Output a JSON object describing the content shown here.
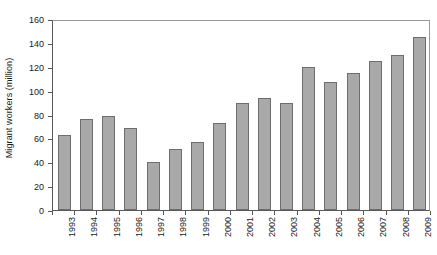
{
  "chart_data": {
    "type": "bar",
    "title": "",
    "subtitle": "",
    "xlabel": "",
    "ylabel": "Migrant workers (million)",
    "categories": [
      "1993",
      "1994",
      "1995",
      "1996",
      "1997",
      "1998",
      "1999",
      "2000",
      "2001",
      "2002",
      "2003",
      "2004",
      "2005",
      "2006",
      "2007",
      "2008",
      "2009"
    ],
    "values": [
      63,
      76,
      79,
      69,
      40,
      51,
      57,
      73,
      90,
      94,
      90,
      120,
      107,
      115,
      125,
      130,
      145
    ],
    "ylim": [
      0,
      160
    ],
    "ytick_values": [
      0,
      20,
      40,
      60,
      80,
      100,
      120,
      140,
      160
    ],
    "ytick_labels": [
      "0",
      "20",
      "40",
      "60",
      "80",
      "100",
      "120",
      "140",
      "160"
    ],
    "grid": false,
    "legend": null,
    "legend_position": "none",
    "annotations": [],
    "bar_color": "#a9a9a9",
    "bar_edge_color": "#6e6e6e",
    "axis_color": "#585858",
    "text_color": "#1a1a1a",
    "background_color": "#ffffff"
  }
}
